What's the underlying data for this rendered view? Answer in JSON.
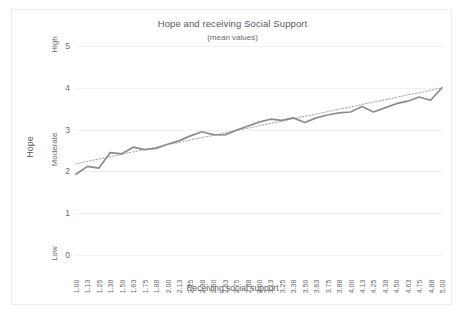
{
  "chart_data": {
    "type": "line",
    "title": "Hope and receiving Social Support",
    "subtitle": "(mean values)",
    "xlabel": "Receiving social support",
    "ylabel": "Hope",
    "ylim": [
      0,
      5
    ],
    "yticks": [
      "0",
      "1",
      "2",
      "3",
      "4",
      "5"
    ],
    "y_category_labels": [
      {
        "label": "Low",
        "value": 0
      },
      {
        "label": "Moderate",
        "value": 2.5
      },
      {
        "label": "High",
        "value": 5
      }
    ],
    "grid": true,
    "legend": "none",
    "line_color": "#8c8c8c",
    "trendline_color": "#a6a6a6",
    "categories": [
      "1.00",
      "1.13",
      "1.25",
      "1.38",
      "1.50",
      "1.63",
      "1.75",
      "1.88",
      "2.00",
      "2.13",
      "2.25",
      "2.38",
      "2.50",
      "2.63",
      "2.75",
      "2.88",
      "3.00",
      "3.13",
      "3.25",
      "3.38",
      "3.50",
      "3.63",
      "3.75",
      "3.88",
      "4.00",
      "4.13",
      "4.25",
      "4.38",
      "4.50",
      "4.63",
      "4.75",
      "4.88",
      "5.00"
    ],
    "series": [
      {
        "name": "Hope (mean)",
        "style": "solid",
        "values": [
          1.93,
          2.12,
          2.08,
          2.45,
          2.42,
          2.58,
          2.52,
          2.55,
          2.65,
          2.73,
          2.85,
          2.95,
          2.88,
          2.87,
          2.98,
          3.08,
          3.18,
          3.25,
          3.22,
          3.28,
          3.17,
          3.28,
          3.35,
          3.4,
          3.42,
          3.55,
          3.42,
          3.52,
          3.62,
          3.68,
          3.78,
          3.7,
          4.0
        ]
      },
      {
        "name": "Linear trendline",
        "style": "dotted",
        "values": [
          2.18,
          2.24,
          2.3,
          2.35,
          2.41,
          2.47,
          2.52,
          2.58,
          2.64,
          2.69,
          2.75,
          2.81,
          2.86,
          2.92,
          2.98,
          3.03,
          3.09,
          3.15,
          3.2,
          3.26,
          3.32,
          3.37,
          3.43,
          3.49,
          3.54,
          3.6,
          3.66,
          3.71,
          3.77,
          3.83,
          3.88,
          3.94,
          4.0
        ]
      }
    ]
  }
}
